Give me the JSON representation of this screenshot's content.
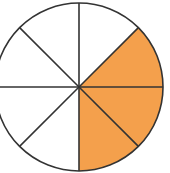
{
  "diagram": {
    "type": "fraction-circle",
    "total_parts": 8,
    "shaded_parts": 3,
    "fraction_label": "3/8",
    "shaded_segments": [
      {
        "index": 0,
        "start_deg": -45,
        "end_deg": 0
      },
      {
        "index": 1,
        "start_deg": 0,
        "end_deg": 45
      },
      {
        "index": 2,
        "start_deg": 45,
        "end_deg": 90
      }
    ],
    "colors": {
      "shaded_fill": "#F4A04C",
      "unshaded_fill": "#FFFFFF",
      "stroke": "#333333"
    },
    "geometry": {
      "cx": 79,
      "cy": 87,
      "r": 84
    }
  }
}
